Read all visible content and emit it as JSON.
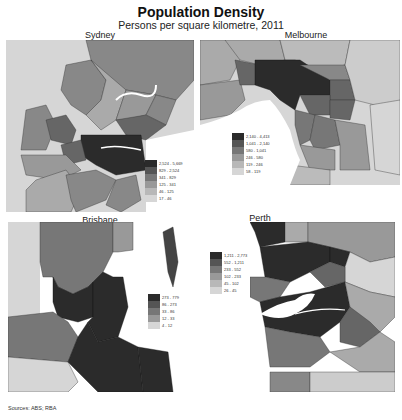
{
  "header": {
    "title": "Population Density",
    "subtitle": "Persons per square kilometre, 2011"
  },
  "panels": {
    "sydney": {
      "label": "Sydney"
    },
    "melbourne": {
      "label": "Melbourne"
    },
    "brisbane": {
      "label": "Brisbane"
    },
    "perth": {
      "label": "Perth"
    }
  },
  "legends": {
    "sydney": [
      "2,524 - 5,669",
      "829 - 2,524",
      "341 - 829",
      "125 - 341",
      "46 - 125",
      "17 - 46"
    ],
    "melbourne": [
      "2,140 - 4,413",
      "1,041 - 2,140",
      "580 - 1,041",
      "246 - 580",
      "119 - 246",
      "58 - 119"
    ],
    "brisbane": [
      "273 - 779",
      "86 - 273",
      "33 - 86",
      "12 - 33",
      "4 - 12"
    ],
    "perth": [
      "1,211 - 2,773",
      "552 - 1,211",
      "233 - 552",
      "102 - 233",
      "45 - 102",
      "26 - 45"
    ]
  },
  "colors": {
    "class1": "#2b2b2b",
    "class2": "#555555",
    "class3": "#777777",
    "class4": "#999999",
    "class5": "#b8b8b8",
    "class6": "#d6d6d6",
    "water": "#ffffff",
    "border": "#333333"
  },
  "footer": {
    "source": "Sources: ABS; RBA"
  }
}
